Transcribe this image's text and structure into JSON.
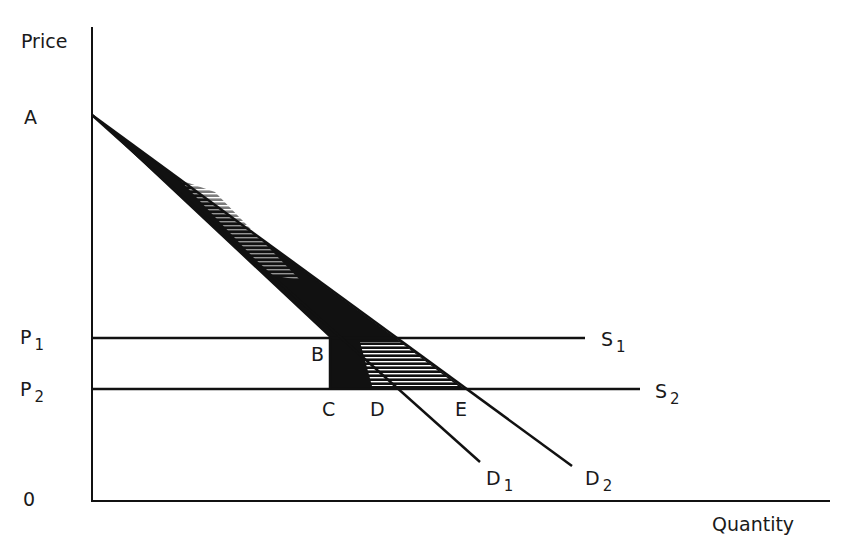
{
  "axes": {
    "y_label": "Price",
    "x_label": "Quantity",
    "origin_label": "0"
  },
  "price_levels": [
    {
      "label": "P",
      "sub": "1"
    },
    {
      "label": "P",
      "sub": "2"
    }
  ],
  "points": {
    "A": "A",
    "B": "B",
    "C": "C",
    "D": "D",
    "E": "E"
  },
  "curves": {
    "S1": {
      "label": "S",
      "sub": "1"
    },
    "S2": {
      "label": "S",
      "sub": "2"
    },
    "D1": {
      "label": "D",
      "sub": "1"
    },
    "D2": {
      "label": "D",
      "sub": "2"
    }
  },
  "colors": {
    "ink": "#111111",
    "background": "#ffffff"
  }
}
